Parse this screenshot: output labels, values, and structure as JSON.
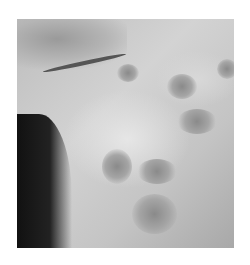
{
  "image": {
    "description": "Grayscale clinical photograph of skin near mouth/chin with multiple papular lesions",
    "caption": ""
  }
}
